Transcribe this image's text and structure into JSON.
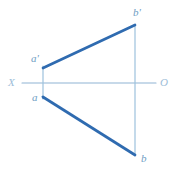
{
  "figure": {
    "kind": "descriptive-geometry-projection",
    "background_color": "#ffffff",
    "width": 188,
    "height": 173
  },
  "colors": {
    "thick_line": "#2f6bb0",
    "thin_line": "#9dc2dd",
    "axis_line": "#8fb4d4",
    "vertex_label_text": "#6f9ec4",
    "axis_label_text": "#9dbdd8"
  },
  "axis": {
    "name": "ground-line",
    "start_label": "X",
    "end_label": "O",
    "y": 83,
    "x_start": 22,
    "x_end": 156
  },
  "points": {
    "a_prime": {
      "label": "a'",
      "x": 43,
      "y": 68,
      "label_x": 31,
      "label_y": 53
    },
    "a": {
      "label": "a",
      "x": 43,
      "y": 97,
      "label_x": 31,
      "label_y": 94
    },
    "b_prime": {
      "label": "b'",
      "x": 135,
      "y": 25,
      "label_x": 133,
      "label_y": 8
    },
    "b": {
      "label": "b",
      "x": 135,
      "y": 155,
      "label_x": 140,
      "label_y": 155
    }
  },
  "segments": [
    {
      "name": "segment-a-prime-b-prime",
      "from": "a_prime",
      "to": "b_prime",
      "weight": "thick"
    },
    {
      "name": "segment-a-b",
      "from": "a",
      "to": "b",
      "weight": "thick"
    },
    {
      "name": "connector-left-vertical",
      "from": "a_prime",
      "to": "a",
      "weight": "thin"
    },
    {
      "name": "connector-right-vertical",
      "from": "b_prime",
      "to": "b",
      "weight": "thin"
    }
  ],
  "stroke_widths": {
    "thick": 2.6,
    "thin": 1.1,
    "axis": 1.1
  }
}
